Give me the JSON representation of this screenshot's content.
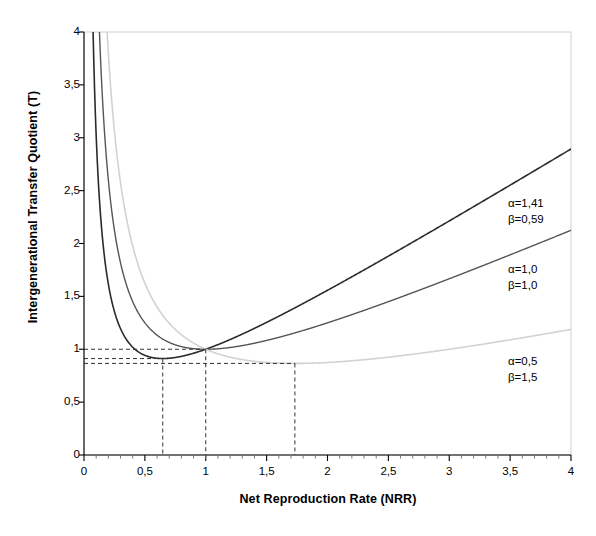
{
  "chart_data": {
    "type": "line",
    "title": "",
    "xlabel": "Net Reproduction Rate (NRR)",
    "ylabel": "Intergenerational Transfer Quotient (T)",
    "xlim": [
      0,
      4
    ],
    "ylim": [
      0,
      4
    ],
    "xticks": [
      0,
      0.5,
      1,
      1.5,
      2,
      2.5,
      3,
      3.5,
      4
    ],
    "xticklabels": [
      "0",
      "0,5",
      "1",
      "1,5",
      "2",
      "2,5",
      "3",
      "3,5",
      "4"
    ],
    "yticks": [
      0,
      0.5,
      1,
      1.5,
      2,
      2.5,
      3,
      3.5,
      4
    ],
    "yticklabels": [
      "0",
      "0,5",
      "1",
      "1,5",
      "2",
      "2,5",
      "3",
      "3,5",
      "4"
    ],
    "x_minor_ticks": true,
    "y_minor_ticks": false,
    "grid": false,
    "legend_position": "inside-right-annotations",
    "formula": "T = alpha*NRR + beta/NRR",
    "series": [
      {
        "name": "alpha=1,41 beta=0,59",
        "alpha": 1.41,
        "beta": 0.59,
        "color": "#2b2b2b",
        "width": 1.6,
        "label_lines": [
          "α=1,41",
          "β=0,59"
        ],
        "minimum": {
          "x": 0.647,
          "y": 1.824
        },
        "passes_through": {
          "x": 1,
          "y": 1
        },
        "endpoint": {
          "x": 4,
          "y": 2.787
        },
        "x": [
          0.15,
          0.2,
          0.25,
          0.3,
          0.4,
          0.5,
          0.6,
          0.647,
          0.7,
          0.8,
          0.9,
          1,
          1.2,
          1.5,
          2,
          2.5,
          3,
          3.5,
          4
        ],
        "y": [
          4.13,
          3.23,
          2.71,
          2.39,
          2.04,
          1.89,
          1.83,
          1.824,
          1.83,
          1.86,
          1.92,
          2.0,
          2.18,
          2.51,
          3.11,
          3.76,
          4.43,
          5.1,
          5.79
        ]
      },
      {
        "name": "alpha=1,0 beta=1,0",
        "alpha": 1.0,
        "beta": 1.0,
        "color": "#555555",
        "width": 1.4,
        "label_lines": [
          "α=1,0",
          "β=1,0"
        ],
        "minimum": {
          "x": 1.0,
          "y": 2.0
        },
        "passes_through": {
          "x": 1,
          "y": 1
        },
        "endpoint": {
          "x": 4,
          "y": 2.18
        },
        "x": [
          0.25,
          0.3,
          0.4,
          0.5,
          0.6,
          0.8,
          1,
          1.2,
          1.5,
          2,
          2.5,
          3,
          3.5,
          4
        ],
        "y": [
          4.25,
          3.63,
          2.9,
          2.5,
          2.27,
          2.05,
          2.0,
          2.03,
          2.17,
          2.5,
          2.9,
          3.33,
          3.79,
          4.25
        ]
      },
      {
        "name": "alpha=0,5 beta=1,5",
        "alpha": 0.5,
        "beta": 1.5,
        "color": "#d2d2d2",
        "width": 1.6,
        "label_lines": [
          "α=0,5",
          "β=1,5"
        ],
        "minimum": {
          "x": 1.732,
          "y": 1.732
        },
        "passes_through": {
          "x": 1,
          "y": 1
        },
        "endpoint": {
          "x": 4,
          "y": 1.04
        },
        "x": [
          0.4,
          0.5,
          0.6,
          0.8,
          1,
          1.2,
          1.5,
          1.732,
          2,
          2.5,
          3,
          3.5,
          4
        ],
        "y": [
          3.95,
          3.25,
          2.8,
          2.28,
          2.0,
          1.85,
          1.75,
          1.732,
          1.75,
          1.85,
          2.0,
          2.18,
          2.38
        ]
      }
    ],
    "guide_lines": {
      "style": "dashed",
      "color": "#333333",
      "vertical_at_x": [
        0.647,
        1.0,
        1.732
      ],
      "horizontal_at_y": [
        1.0,
        0.931,
        0.866
      ],
      "note": "dashed markers indicate curve minima projected to axes"
    }
  },
  "annotations": [
    {
      "lines": [
        "α=1,41",
        "β=0,59"
      ],
      "x_px": 508,
      "y_px": 196
    },
    {
      "lines": [
        "α=1,0",
        "β=1,0"
      ],
      "x_px": 508,
      "y_px": 262
    },
    {
      "lines": [
        "α=0,5",
        "β=1,5"
      ],
      "x_px": 508,
      "y_px": 354
    }
  ],
  "axis": {
    "axis_color": "#000000",
    "frame_color": "#cfcfcf",
    "background": "#ffffff"
  }
}
